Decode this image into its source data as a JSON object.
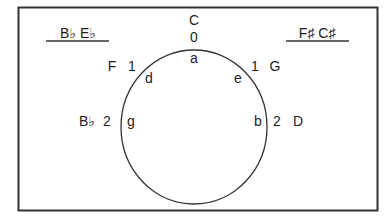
{
  "diagram": {
    "type": "circle-of-fifths-fragment",
    "colors": {
      "stroke": "#333333",
      "text": "#1e1e1e",
      "background": "#ffffff"
    },
    "header_left": {
      "text": "B♭  E♭"
    },
    "header_right": {
      "text": "F♯  C♯"
    },
    "top": {
      "key": "C",
      "count": "0",
      "minor": "a"
    },
    "upper_left": {
      "key": "F",
      "count": "1",
      "minor": "d"
    },
    "upper_right": {
      "key": "G",
      "count": "1",
      "minor": "e"
    },
    "mid_left": {
      "key": "B♭",
      "count": "2",
      "minor": "g"
    },
    "mid_right": {
      "key": "D",
      "count": "2",
      "minor": "b"
    }
  }
}
